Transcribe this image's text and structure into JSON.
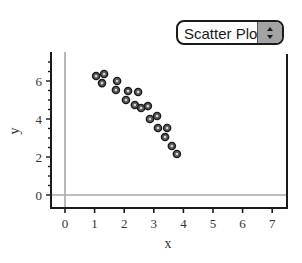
{
  "plot_type_selector": {
    "selected": "Scatter Plot",
    "icon": "up-down-stepper-icon"
  },
  "chart_data": {
    "type": "scatter",
    "title": "",
    "xlabel": "x",
    "ylabel": "y",
    "xlim": [
      -0.5,
      7.5
    ],
    "ylim": [
      -0.7,
      7.4
    ],
    "x_ticks": [
      0,
      1,
      2,
      3,
      4,
      5,
      6,
      7
    ],
    "y_ticks": [
      0,
      2,
      4,
      6
    ],
    "y_minor_tick_step": 0.5,
    "grid": false,
    "zero_lines": true,
    "legend": null,
    "series": [
      {
        "name": "data",
        "marker": "ring",
        "x": [
          1.05,
          1.32,
          1.25,
          1.76,
          1.72,
          2.13,
          2.47,
          2.06,
          2.36,
          2.57,
          2.8,
          2.87,
          3.11,
          3.14,
          3.45,
          3.38,
          3.61,
          3.78
        ],
        "y": [
          6.26,
          6.37,
          5.89,
          6.0,
          5.53,
          5.47,
          5.42,
          5.0,
          4.74,
          4.58,
          4.68,
          4.0,
          4.16,
          3.53,
          3.53,
          3.05,
          2.58,
          2.16
        ]
      }
    ],
    "colors": {
      "axis": "#1a1a1a",
      "zero_line": "#a8a8a8",
      "marker_fill": "#5a5a5a",
      "marker_ring": "#1a1a1a"
    }
  }
}
